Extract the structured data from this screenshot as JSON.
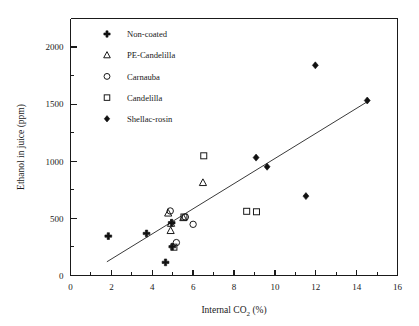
{
  "chart_data": {
    "type": "scatter",
    "title": "",
    "xlabel": "Internal CO2  (%)",
    "xlabel_main": "Internal CO",
    "xlabel_sub": "2",
    "xlabel_unit": "(%)",
    "ylabel": "Ethanol in juice (ppm)",
    "xlim": [
      0,
      16
    ],
    "ylim": [
      0,
      2250
    ],
    "xticks": [
      0,
      2,
      4,
      6,
      8,
      10,
      12,
      14,
      16
    ],
    "xticklabels": [
      "0",
      "2",
      "4",
      "6",
      "8",
      "10",
      "12",
      "14",
      "16"
    ],
    "yticks": [
      0,
      500,
      1000,
      1500,
      2000
    ],
    "yticklabels": [
      "0",
      "500",
      "1000",
      "1500",
      "2000"
    ],
    "x_minor_interval": 1,
    "y_minor_interval": 250,
    "grid": false,
    "legend_position": "upper-left-inside",
    "trendline": {
      "x_start": 1.78,
      "y_start": 120,
      "x_end": 14.6,
      "y_end": 1530,
      "style": "solid",
      "color": "#3a3a3a"
    },
    "series": [
      {
        "name": "Non-coated",
        "marker": "plus-filled",
        "points": [
          {
            "x": 1.85,
            "y": 345
          },
          {
            "x": 3.72,
            "y": 368
          },
          {
            "x": 4.95,
            "y": 462
          },
          {
            "x": 4.98,
            "y": 252
          },
          {
            "x": 4.65,
            "y": 115
          }
        ]
      },
      {
        "name": "PE-Candelilla",
        "marker": "triangle-open",
        "points": [
          {
            "x": 4.78,
            "y": 545
          },
          {
            "x": 4.92,
            "y": 455
          },
          {
            "x": 4.9,
            "y": 392
          },
          {
            "x": 5.52,
            "y": 505
          },
          {
            "x": 6.48,
            "y": 812
          }
        ]
      },
      {
        "name": "Carnauba",
        "marker": "circle-open",
        "points": [
          {
            "x": 4.88,
            "y": 565
          },
          {
            "x": 5.18,
            "y": 288
          },
          {
            "x": 5.62,
            "y": 512
          },
          {
            "x": 6.0,
            "y": 448
          }
        ]
      },
      {
        "name": "Candelilla",
        "marker": "square-open",
        "points": [
          {
            "x": 5.55,
            "y": 512
          },
          {
            "x": 5.06,
            "y": 248
          },
          {
            "x": 6.52,
            "y": 1048
          },
          {
            "x": 8.62,
            "y": 562
          },
          {
            "x": 9.1,
            "y": 558
          }
        ]
      },
      {
        "name": "Shellac-rosin",
        "marker": "diamond-filled",
        "points": [
          {
            "x": 9.08,
            "y": 1032
          },
          {
            "x": 9.62,
            "y": 952
          },
          {
            "x": 11.52,
            "y": 695
          },
          {
            "x": 11.98,
            "y": 1840
          },
          {
            "x": 14.52,
            "y": 1532
          }
        ]
      }
    ]
  },
  "legend": {
    "entries": [
      {
        "label": "Non-coated",
        "marker": "plus-filled"
      },
      {
        "label": "PE-Candelilla",
        "marker": "triangle-open"
      },
      {
        "label": "Carnauba",
        "marker": "circle-open"
      },
      {
        "label": "Candelilla",
        "marker": "square-open"
      },
      {
        "label": "Shellac-rosin",
        "marker": "diamond-filled"
      }
    ]
  },
  "colors": {
    "axis": "#1a1a1a",
    "marker": "#111111",
    "trendline": "#3a3a3a",
    "background": "#ffffff"
  }
}
